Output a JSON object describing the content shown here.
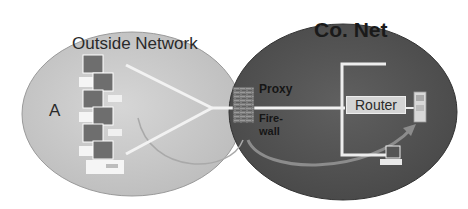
{
  "diagram": {
    "regions": {
      "outside": {
        "title": "Outside Network",
        "label": "A",
        "fill": "#c8c8c8"
      },
      "company": {
        "title": "Co. Net",
        "fill": "#575757"
      }
    },
    "gateway": {
      "proxy_label": "Proxy",
      "firewall_label": "Fire-\nwall",
      "firewall_text": "Fire- wall"
    },
    "internal": {
      "router_label": "Router"
    },
    "colors": {
      "link_line": "#f2f2f2",
      "arrow": "#8a8a8a",
      "firewall_brick": "#7a7a7a",
      "computer_screen": "#6e6e6e"
    }
  }
}
